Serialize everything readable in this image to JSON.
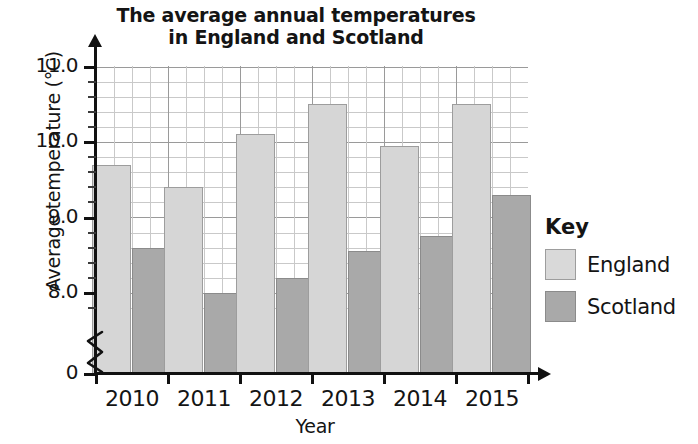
{
  "chart_data": {
    "type": "bar",
    "title": "The average annual temperatures in England and Scotland",
    "title_lines": [
      "The average annual temperatures",
      "in England and Scotland"
    ],
    "xlabel": "Year",
    "ylabel": "Average temperature (°C)",
    "categories": [
      "2010",
      "2011",
      "2012",
      "2013",
      "2014",
      "2015"
    ],
    "series": [
      {
        "name": "England",
        "color": "#d6d6d6",
        "values": [
          9.7,
          9.4,
          10.1,
          10.5,
          9.95,
          10.5
        ]
      },
      {
        "name": "Scotland",
        "color": "#a9a9a9",
        "values": [
          8.6,
          8.0,
          8.2,
          8.55,
          8.75,
          9.3
        ]
      }
    ],
    "ylim": [
      8.0,
      11.2
    ],
    "y_ticks": [
      "0",
      "8.0",
      "9.0",
      "10.0",
      "11.0"
    ],
    "y_tick_values": [
      0,
      8.0,
      9.0,
      10.0,
      11.0
    ],
    "y_minor_step": 0.2,
    "axis_break": true,
    "grid": true,
    "legend_position": "right",
    "legend_title": "Key"
  },
  "key": {
    "title": "Key",
    "entries": [
      {
        "label": "England"
      },
      {
        "label": "Scotland"
      }
    ]
  }
}
